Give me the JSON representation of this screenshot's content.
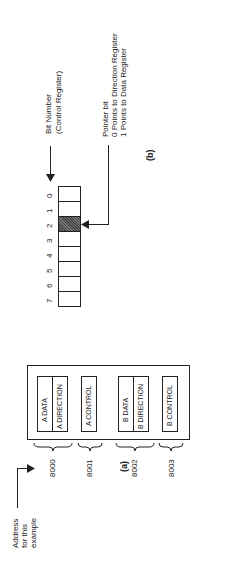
{
  "figure_a": {
    "label": "(a)",
    "address_caption": [
      "Address",
      "for this",
      "example"
    ],
    "registers": [
      {
        "address": "8000",
        "names": [
          "A DATA",
          "A DIRECTION"
        ]
      },
      {
        "address": "8001",
        "names": [
          "A CONTROL"
        ]
      },
      {
        "address": "8002",
        "names": [
          "B DATA",
          "B DIRECTION"
        ]
      },
      {
        "address": "8003",
        "names": [
          "B CONTROL"
        ]
      }
    ]
  },
  "figure_b": {
    "label": "(b)",
    "bit_numbers": [
      "7",
      "6",
      "5",
      "4",
      "3",
      "2",
      "1",
      "0"
    ],
    "highlighted_bit": "2",
    "bit_number_caption": [
      "Bit Number",
      "(Control Register)"
    ],
    "pointer_caption": [
      "Pointer bit",
      "0 Points to Direction Register",
      "1 Points to Data Register"
    ]
  },
  "colors": {
    "ink": "#1a1a1a",
    "shade": "#5a5a5a",
    "background": "#ffffff"
  }
}
